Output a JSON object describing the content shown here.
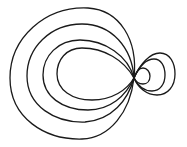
{
  "diagram": {
    "type": "nested-loop-curves",
    "stroke_color": "#1a1a1a",
    "background_color": "#ffffff",
    "node_point": {
      "x": 134,
      "y": 78
    },
    "left_loops": [
      {
        "name": "left-loop-1",
        "left": 10,
        "top": 8,
        "bottom": 139
      },
      {
        "name": "left-loop-2",
        "left": 27,
        "top": 24,
        "bottom": 122
      },
      {
        "name": "left-loop-3",
        "left": 43,
        "top": 40,
        "bottom": 110
      },
      {
        "name": "left-loop-4",
        "left": 57,
        "top": 48,
        "bottom": 100
      }
    ],
    "right_loops": [
      {
        "name": "right-loop-1",
        "right": 175,
        "top": 53,
        "bottom": 95
      },
      {
        "name": "right-loop-2",
        "right": 165,
        "top": 59,
        "bottom": 91
      },
      {
        "name": "right-loop-3",
        "right": 150,
        "top": 68,
        "bottom": 84
      }
    ]
  }
}
